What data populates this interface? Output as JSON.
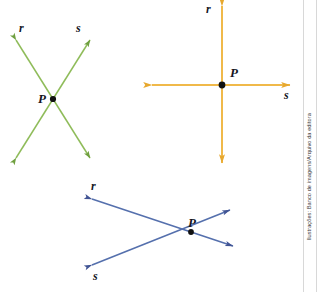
{
  "page": {
    "width": 317,
    "height": 292,
    "background": "#ffffff"
  },
  "credit": {
    "text": "Ilustrações: Banco de imagens/Arquivo da editora"
  },
  "figures": [
    {
      "id": "green-x-lines",
      "name": "intersecting-lines-green",
      "color": "#7caa4a",
      "point_label": "P",
      "line_labels": {
        "r": "r",
        "s": "s"
      },
      "description": "Two green lines r and s crossing in an X shape at point P"
    },
    {
      "id": "orange-perpendicular-lines",
      "name": "intersecting-lines-orange",
      "color": "#eeaf3b",
      "point_label": "P",
      "line_labels": {
        "r": "r",
        "s": "s"
      },
      "description": "Vertical line r and horizontal line s meeting perpendicularly at point P"
    },
    {
      "id": "blue-oblique-lines",
      "name": "intersecting-lines-blue",
      "color": "#4a5fa5",
      "point_label": "P",
      "line_labels": {
        "r": "r",
        "s": "s"
      },
      "description": "Two blue lines r and s crossing obliquely at point P"
    }
  ]
}
